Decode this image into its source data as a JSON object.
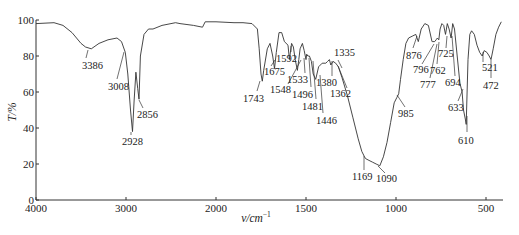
{
  "chart_data": {
    "type": "line",
    "title": "",
    "xlabel": "v/cm⁻¹",
    "ylabel": "T/%",
    "xlim": [
      4000,
      400
    ],
    "ylim": [
      0,
      100
    ],
    "x_axis_break_note": "4000–2000 compressed scale; 2000–400 expanded scale",
    "x_ticks": [
      4000,
      3000,
      2000,
      1500,
      1000,
      500
    ],
    "y_ticks": [
      0,
      20,
      40,
      60,
      80,
      100
    ],
    "grid": false,
    "legend": null,
    "series": [
      {
        "name": "IR spectrum",
        "points": [
          [
            4000,
            98
          ],
          [
            3800,
            98.5
          ],
          [
            3700,
            97
          ],
          [
            3600,
            93
          ],
          [
            3500,
            87
          ],
          [
            3450,
            85
          ],
          [
            3386,
            84
          ],
          [
            3300,
            87
          ],
          [
            3200,
            89
          ],
          [
            3100,
            90
          ],
          [
            3050,
            88
          ],
          [
            3008,
            82
          ],
          [
            2980,
            70
          ],
          [
            2950,
            50
          ],
          [
            2928,
            38
          ],
          [
            2910,
            55
          ],
          [
            2890,
            71
          ],
          [
            2870,
            62
          ],
          [
            2856,
            56
          ],
          [
            2840,
            80
          ],
          [
            2800,
            92
          ],
          [
            2750,
            95
          ],
          [
            2700,
            95
          ],
          [
            2600,
            97
          ],
          [
            2500,
            98
          ],
          [
            2450,
            98.5
          ],
          [
            2400,
            98
          ],
          [
            2250,
            97
          ],
          [
            2150,
            96
          ],
          [
            2120,
            99
          ],
          [
            2000,
            99
          ],
          [
            1900,
            98.5
          ],
          [
            1850,
            98.5
          ],
          [
            1800,
            98
          ],
          [
            1770,
            95
          ],
          [
            1760,
            84
          ],
          [
            1750,
            70
          ],
          [
            1743,
            66
          ],
          [
            1735,
            72
          ],
          [
            1715,
            84
          ],
          [
            1700,
            87
          ],
          [
            1685,
            80
          ],
          [
            1675,
            73
          ],
          [
            1665,
            82
          ],
          [
            1650,
            93
          ],
          [
            1635,
            93
          ],
          [
            1620,
            88
          ],
          [
            1600,
            86
          ],
          [
            1592,
            78
          ],
          [
            1580,
            87
          ],
          [
            1570,
            85
          ],
          [
            1560,
            78
          ],
          [
            1548,
            72
          ],
          [
            1540,
            78
          ],
          [
            1533,
            84
          ],
          [
            1520,
            87
          ],
          [
            1510,
            83
          ],
          [
            1500,
            78
          ],
          [
            1496,
            81
          ],
          [
            1490,
            80
          ],
          [
            1481,
            80
          ],
          [
            1470,
            77
          ],
          [
            1460,
            70
          ],
          [
            1446,
            67
          ],
          [
            1430,
            74
          ],
          [
            1410,
            76
          ],
          [
            1390,
            76
          ],
          [
            1380,
            77
          ],
          [
            1370,
            78
          ],
          [
            1362,
            75
          ],
          [
            1350,
            77
          ],
          [
            1335,
            76
          ],
          [
            1320,
            74
          ],
          [
            1300,
            68
          ],
          [
            1270,
            58
          ],
          [
            1240,
            46
          ],
          [
            1210,
            34
          ],
          [
            1190,
            27
          ],
          [
            1175,
            24
          ],
          [
            1169,
            23
          ],
          [
            1150,
            22
          ],
          [
            1130,
            21
          ],
          [
            1110,
            20
          ],
          [
            1090,
            19
          ],
          [
            1070,
            24
          ],
          [
            1050,
            32
          ],
          [
            1030,
            43
          ],
          [
            1010,
            54
          ],
          [
            995,
            57
          ],
          [
            985,
            59
          ],
          [
            975,
            67
          ],
          [
            960,
            78
          ],
          [
            945,
            87
          ],
          [
            930,
            90
          ],
          [
            910,
            91
          ],
          [
            890,
            92
          ],
          [
            876,
            88
          ],
          [
            860,
            95
          ],
          [
            840,
            98
          ],
          [
            820,
            97
          ],
          [
            800,
            88
          ],
          [
            796,
            88
          ],
          [
            785,
            88
          ],
          [
            777,
            89
          ],
          [
            770,
            90
          ],
          [
            762,
            89
          ],
          [
            755,
            95
          ],
          [
            745,
            98
          ],
          [
            735,
            97
          ],
          [
            725,
            92
          ],
          [
            715,
            98
          ],
          [
            705,
            95
          ],
          [
            694,
            90
          ],
          [
            685,
            98
          ],
          [
            675,
            95
          ],
          [
            660,
            80
          ],
          [
            645,
            65
          ],
          [
            633,
            60
          ],
          [
            625,
            50
          ],
          [
            615,
            45
          ],
          [
            610,
            42
          ],
          [
            600,
            78
          ],
          [
            590,
            92
          ],
          [
            580,
            94
          ],
          [
            565,
            92
          ],
          [
            550,
            86
          ],
          [
            535,
            82
          ],
          [
            521,
            80
          ],
          [
            510,
            83
          ],
          [
            495,
            82
          ],
          [
            482,
            80
          ],
          [
            472,
            78
          ],
          [
            460,
            84
          ],
          [
            445,
            92
          ],
          [
            430,
            96
          ],
          [
            415,
            99
          ]
        ]
      }
    ],
    "annotations": [
      {
        "label": "3386",
        "x": 3386
      },
      {
        "label": "3008",
        "x": 3008
      },
      {
        "label": "2928",
        "x": 2928
      },
      {
        "label": "2856",
        "x": 2856
      },
      {
        "label": "1743",
        "x": 1743
      },
      {
        "label": "1675",
        "x": 1675
      },
      {
        "label": "1592",
        "x": 1592
      },
      {
        "label": "1548",
        "x": 1548
      },
      {
        "label": "1533",
        "x": 1533
      },
      {
        "label": "1496",
        "x": 1496
      },
      {
        "label": "1481",
        "x": 1481
      },
      {
        "label": "1446",
        "x": 1446
      },
      {
        "label": "1380",
        "x": 1380
      },
      {
        "label": "1362",
        "x": 1362
      },
      {
        "label": "1335",
        "x": 1335
      },
      {
        "label": "1169",
        "x": 1169
      },
      {
        "label": "1090",
        "x": 1090
      },
      {
        "label": "985",
        "x": 985
      },
      {
        "label": "876",
        "x": 876
      },
      {
        "label": "796",
        "x": 796
      },
      {
        "label": "777",
        "x": 777
      },
      {
        "label": "762",
        "x": 762
      },
      {
        "label": "725",
        "x": 725
      },
      {
        "label": "694",
        "x": 694
      },
      {
        "label": "633",
        "x": 633
      },
      {
        "label": "610",
        "x": 610
      },
      {
        "label": "521",
        "x": 521
      },
      {
        "label": "472",
        "x": 472
      }
    ]
  },
  "labels": {
    "ylabel": "T/%",
    "xlabel_main": "v/cm",
    "xlabel_sup": "−1"
  },
  "peak_label_positions": [
    {
      "label": "3386",
      "lx": 82,
      "ly": 69,
      "px": 88,
      "py": 50,
      "tx": 86,
      "ty": 58
    },
    {
      "label": "3008",
      "lx": 108,
      "ly": 90,
      "px": 124,
      "py": 52,
      "tx": 117,
      "ty": 79
    },
    {
      "label": "2928",
      "lx": 122,
      "ly": 145,
      "px": 131,
      "py": 132,
      "tx": 131,
      "ty": 135
    },
    {
      "label": "2856",
      "lx": 137,
      "ly": 118,
      "px": 139,
      "py": 100,
      "tx": 143,
      "ty": 108
    },
    {
      "label": "1743",
      "lx": 243,
      "ly": 102,
      "px": 260,
      "py": 81,
      "tx": 257,
      "ty": 91
    },
    {
      "label": "1675",
      "lx": 264,
      "ly": 75,
      "px": 275,
      "py": 60,
      "tx": 271,
      "ty": 66
    },
    {
      "label": "1592",
      "lx": 276,
      "ly": 62,
      "px": 291,
      "py": 46,
      "tx": 291,
      "ty": 52
    },
    {
      "label": "1548",
      "lx": 270,
      "ly": 93,
      "px": 301,
      "py": 60,
      "tx": 288,
      "ty": 84
    },
    {
      "label": "1533",
      "lx": 287,
      "ly": 83,
      "px": 304,
      "py": 58,
      "tx": 305,
      "ty": 73
    },
    {
      "label": "1496",
      "lx": 292,
      "ly": 98,
      "px": 309,
      "py": 58,
      "tx": 311,
      "ty": 87
    },
    {
      "label": "1481",
      "lx": 302,
      "ly": 110,
      "px": 313,
      "py": 61,
      "tx": 316,
      "ty": 99
    },
    {
      "label": "1446",
      "lx": 316,
      "ly": 124,
      "px": 320,
      "py": 75,
      "tx": 323,
      "ty": 113
    },
    {
      "label": "1380",
      "lx": 316,
      "ly": 86,
      "px": 332,
      "py": 61,
      "tx": 332,
      "ty": 76
    },
    {
      "label": "1362",
      "lx": 330,
      "ly": 97,
      "px": 338,
      "py": 66,
      "tx": 347,
      "ty": 88
    },
    {
      "label": "1335",
      "lx": 334,
      "ly": 56,
      "px": 342,
      "py": 68,
      "tx": 338,
      "ty": 60
    },
    {
      "label": "1169",
      "lx": 352,
      "ly": 180,
      "px": 364,
      "py": 156,
      "tx": 364,
      "ty": 170
    },
    {
      "label": "1090",
      "lx": 376,
      "ly": 182,
      "px": 378,
      "py": 166,
      "tx": 385,
      "ty": 173
    },
    {
      "label": "985",
      "lx": 398,
      "ly": 117,
      "px": 397,
      "py": 95,
      "tx": 405,
      "ty": 107
    },
    {
      "label": "876",
      "lx": 406,
      "ly": 59,
      "px": 417,
      "py": 36,
      "tx": 413,
      "ty": 48
    },
    {
      "label": "796",
      "lx": 413,
      "ly": 73,
      "px": 434,
      "py": 44,
      "tx": 422,
      "ty": 64
    },
    {
      "label": "777",
      "lx": 420,
      "ly": 88,
      "px": 437,
      "py": 44,
      "tx": 430,
      "ty": 78
    },
    {
      "label": "762",
      "lx": 430,
      "ly": 74,
      "px": 439,
      "py": 42,
      "tx": 437,
      "ty": 64
    },
    {
      "label": "725",
      "lx": 438,
      "ly": 57,
      "px": 447,
      "py": 36,
      "tx": 446,
      "ty": 48
    },
    {
      "label": "694",
      "lx": 445,
      "ly": 86,
      "px": 452,
      "py": 36,
      "tx": 455,
      "ty": 76
    },
    {
      "label": "633",
      "lx": 448,
      "ly": 111,
      "px": 463,
      "py": 89,
      "tx": 458,
      "ty": 101
    },
    {
      "label": "610",
      "lx": 458,
      "ly": 144,
      "px": 467,
      "py": 116,
      "tx": 467,
      "ty": 132
    },
    {
      "label": "521",
      "lx": 482,
      "ly": 71,
      "px": 483,
      "py": 52,
      "tx": 483,
      "ty": 62
    },
    {
      "label": "472",
      "lx": 483,
      "ly": 89,
      "px": 491,
      "py": 60,
      "tx": 491,
      "ty": 78
    }
  ]
}
